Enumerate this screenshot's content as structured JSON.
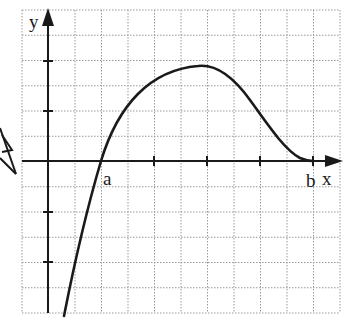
{
  "figure": {
    "axis_labels": {
      "x": "x",
      "y": "y"
    },
    "point_labels": {
      "a": "a",
      "b": "b"
    },
    "colors": {
      "curve": "#1a1a1a",
      "grid": "#9a9a9a",
      "axis": "#1a1a1a",
      "background": "#ffffff"
    }
  },
  "chart_data": {
    "type": "line",
    "title": "",
    "xlabel": "x",
    "ylabel": "y",
    "grid": true,
    "grid_units": {
      "x_range": [
        -1,
        11
      ],
      "y_range": [
        -6,
        6
      ]
    },
    "x_ticks": [
      2,
      4,
      6,
      8,
      10
    ],
    "y_ticks": [
      -4,
      -2,
      2,
      4
    ],
    "marked_points": [
      {
        "label": "a",
        "x": 2,
        "y": 0
      },
      {
        "label": "b",
        "x": 10,
        "y": 0
      }
    ],
    "series": [
      {
        "name": "f(x)",
        "x": [
          0.6,
          1.0,
          1.5,
          2.0,
          2.5,
          3.0,
          3.5,
          4.0,
          4.5,
          5.0,
          5.5,
          6.0,
          6.5,
          7.0,
          7.5,
          8.0,
          8.5,
          9.0,
          9.5,
          10.0
        ],
        "y": [
          -6.0,
          -4.3,
          -2.1,
          0.0,
          1.6,
          2.9,
          3.7,
          4.2,
          4.5,
          4.6,
          4.5,
          4.1,
          3.4,
          2.5,
          1.7,
          1.0,
          0.5,
          0.2,
          0.05,
          0.0
        ]
      }
    ],
    "max_point": {
      "x": 5.0,
      "y": 3.8
    }
  }
}
